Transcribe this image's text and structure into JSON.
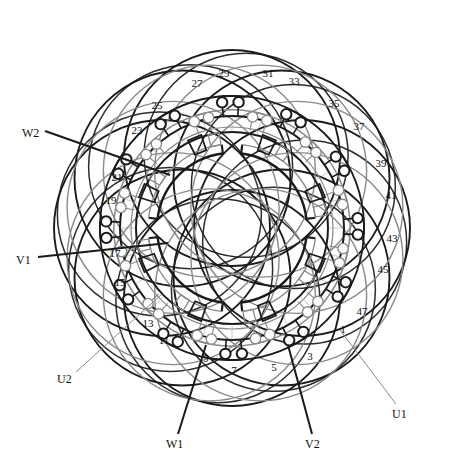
{
  "figure": {
    "type": "stator-winding-end-view",
    "title": "",
    "slot_count": 48,
    "center": {
      "x": 232,
      "y": 228
    },
    "colors": {
      "ink": "#111111",
      "bold_stroke": "#1a1a1a",
      "light_stroke": "#8a8a8a",
      "background": "#ffffff"
    },
    "geometry": {
      "bore_radius": 75,
      "bore_ring_outer": 84,
      "yoke_inner_radius": 96,
      "yoke_outer_radius": 112,
      "terminal_ring_outer_radius": 126,
      "terminal_ring_inner_radius": 112,
      "coil_arc_radius": 118,
      "coil_lobe_count": 8,
      "outer_envelope_radius": 178
    }
  },
  "slot_labels": [
    {
      "id": "slot-1",
      "text": "1",
      "x": 343,
      "y": 330,
      "ring": "inner"
    },
    {
      "id": "slot-3",
      "text": "3",
      "x": 310,
      "y": 357,
      "ring": "inner"
    },
    {
      "id": "slot-5",
      "text": "5",
      "x": 274,
      "y": 368,
      "ring": "outer"
    },
    {
      "id": "slot-7",
      "text": "7",
      "x": 234,
      "y": 371,
      "ring": "outer"
    },
    {
      "id": "slot-9",
      "text": "9",
      "x": 206,
      "y": 359,
      "ring": "outer"
    },
    {
      "id": "slot-11",
      "text": "11",
      "x": 164,
      "y": 341,
      "ring": "inner"
    },
    {
      "id": "slot-13",
      "text": "13",
      "x": 148,
      "y": 324,
      "ring": "inner"
    },
    {
      "id": "slot-15",
      "text": "15",
      "x": 120,
      "y": 283,
      "ring": "outer"
    },
    {
      "id": "slot-17",
      "text": "17",
      "x": 115,
      "y": 254,
      "ring": "outer"
    },
    {
      "id": "slot-19",
      "text": "19",
      "x": 111,
      "y": 201,
      "ring": "outer"
    },
    {
      "id": "slot-21",
      "text": "21",
      "x": 117,
      "y": 178,
      "ring": "outer"
    },
    {
      "id": "slot-23",
      "text": "23",
      "x": 137,
      "y": 131,
      "ring": "inner"
    },
    {
      "id": "slot-25",
      "text": "25",
      "x": 157,
      "y": 106,
      "ring": "inner"
    },
    {
      "id": "slot-27",
      "text": "27",
      "x": 197,
      "y": 84,
      "ring": "outer"
    },
    {
      "id": "slot-29",
      "text": "29",
      "x": 224,
      "y": 74,
      "ring": "outer"
    },
    {
      "id": "slot-31",
      "text": "31",
      "x": 268,
      "y": 74,
      "ring": "outer"
    },
    {
      "id": "slot-33",
      "text": "33",
      "x": 294,
      "y": 82,
      "ring": "outer"
    },
    {
      "id": "slot-35",
      "text": "35",
      "x": 334,
      "y": 104,
      "ring": "inner"
    },
    {
      "id": "slot-37",
      "text": "37",
      "x": 359,
      "y": 127,
      "ring": "inner"
    },
    {
      "id": "slot-39",
      "text": "39",
      "x": 381,
      "y": 164,
      "ring": "outer"
    },
    {
      "id": "slot-41",
      "text": "41",
      "x": 391,
      "y": 196,
      "ring": "outer"
    },
    {
      "id": "slot-43",
      "text": "43",
      "x": 392,
      "y": 239,
      "ring": "outer"
    },
    {
      "id": "slot-45",
      "text": "45",
      "x": 383,
      "y": 270,
      "ring": "outer"
    },
    {
      "id": "slot-47",
      "text": "47",
      "x": 362,
      "y": 312,
      "ring": "inner"
    }
  ],
  "phase_leads": [
    {
      "id": "lead-w2",
      "text": "W2",
      "label_x": 22,
      "label_y": 134,
      "line_x1": 45,
      "line_y1": 131,
      "line_x2": 170,
      "line_y2": 175,
      "weight": "bold"
    },
    {
      "id": "lead-v1",
      "text": "V1",
      "label_x": 16,
      "label_y": 261,
      "line_x1": 38,
      "line_y1": 257,
      "line_x2": 168,
      "line_y2": 243,
      "weight": "bold"
    },
    {
      "id": "lead-u2",
      "text": "U2",
      "label_x": 57,
      "label_y": 380,
      "line_x1": 76,
      "line_y1": 372,
      "line_x2": 162,
      "line_y2": 294,
      "weight": "light"
    },
    {
      "id": "lead-w1",
      "text": "W1",
      "label_x": 166,
      "label_y": 445,
      "line_x1": 178,
      "line_y1": 434,
      "line_x2": 206,
      "line_y2": 345,
      "weight": "bold"
    },
    {
      "id": "lead-v2",
      "text": "V2",
      "label_x": 305,
      "label_y": 445,
      "line_x1": 312,
      "line_y1": 434,
      "line_x2": 288,
      "line_y2": 345,
      "weight": "bold"
    },
    {
      "id": "lead-u1",
      "text": "U1",
      "label_x": 392,
      "label_y": 415,
      "line_x1": 396,
      "line_y1": 404,
      "line_x2": 340,
      "line_y2": 330,
      "weight": "light"
    }
  ]
}
